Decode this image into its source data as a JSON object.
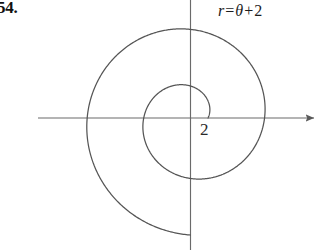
{
  "figure": {
    "problem_number": "54.",
    "equation": {
      "lhs": "r",
      "equals": "=",
      "theta": "θ",
      "plus": "+",
      "constant": "2",
      "full": "r = θ + 2"
    },
    "radius_label": "2",
    "stroke_color": "#555555",
    "axis_color": "#666666",
    "background_color": "#ffffff"
  },
  "chart_data": {
    "type": "line",
    "subtitle": "",
    "plot_kind": "polar-spiral",
    "equation": "r = theta + 2",
    "xlabel": "",
    "ylabel": "",
    "grid": false,
    "legend": null,
    "annotations": [
      {
        "text": "2",
        "x_px": 208,
        "y_px": 118,
        "meaning": "r-intercept at theta = 0"
      },
      {
        "text": "r = θ + 2",
        "x_px": 260,
        "y_px": 11,
        "meaning": "curve equation label"
      },
      {
        "text": "54.",
        "x_px": 10,
        "y_px": 8,
        "meaning": "textbook problem number"
      }
    ],
    "axes": {
      "origin_px": [
        190,
        118
      ],
      "x_axis": {
        "x_start_px": 38,
        "x_end_px": 318,
        "arrow_end": "right",
        "arrow_start": "none"
      },
      "y_axis": {
        "y_start_px": 0,
        "y_end_px": 250,
        "arrow_end": "none",
        "arrow_start": "none"
      },
      "pixels_per_unit": 9.0,
      "xlim_units": [
        -16.9,
        14.2
      ],
      "ylim_units": [
        -14.7,
        13.1
      ]
    },
    "theta_range_rad": [
      0,
      11.0
    ],
    "r_of_theta": "theta + 2",
    "points_polar": [
      {
        "theta_rad": 0.0,
        "r": 2.0
      },
      {
        "theta_rad": 1.5708,
        "r": 3.5708
      },
      {
        "theta_rad": 3.1416,
        "r": 5.1416
      },
      {
        "theta_rad": 4.7124,
        "r": 6.7124
      },
      {
        "theta_rad": 6.2832,
        "r": 8.2832
      },
      {
        "theta_rad": 7.854,
        "r": 9.854
      },
      {
        "theta_rad": 9.4248,
        "r": 11.4248
      },
      {
        "theta_rad": 11.0,
        "r": 13.0
      }
    ],
    "axis_crossings_px": {
      "inner_right_x": 208,
      "inner_top_y": 85,
      "inner_left_x": 140,
      "inner_bottom_y": 180,
      "outer_right_x": 268,
      "outer_top_y": 25,
      "outer_left_x": 75,
      "tail_end": [
        148,
        232
      ]
    }
  }
}
